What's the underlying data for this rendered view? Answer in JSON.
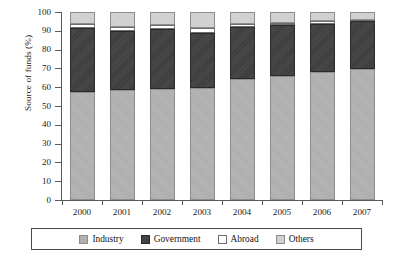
{
  "chart_data": {
    "type": "bar",
    "subtype": "stacked-bar-100",
    "title": "",
    "xlabel": "",
    "ylabel": "Source of funds (%)",
    "ylim": [
      0,
      100
    ],
    "ytick_step": 10,
    "yticks": [
      0,
      10,
      20,
      30,
      40,
      50,
      60,
      70,
      80,
      90,
      100
    ],
    "grid": false,
    "legend_position": "bottom",
    "categories": [
      "2000",
      "2001",
      "2002",
      "2003",
      "2004",
      "2005",
      "2006",
      "2007"
    ],
    "series": [
      {
        "name": "Industry",
        "color": "#b4b4b4",
        "values": [
          57.5,
          58.5,
          59.0,
          59.5,
          64.5,
          66.0,
          68.0,
          69.5
        ]
      },
      {
        "name": "Government",
        "color": "#3f3f3f",
        "values": [
          34.0,
          31.5,
          32.0,
          29.5,
          27.5,
          27.0,
          25.5,
          25.5
        ]
      },
      {
        "name": "Abroad",
        "color": "#ffffff",
        "values": [
          2.0,
          2.0,
          2.0,
          2.5,
          1.5,
          1.0,
          1.5,
          1.0
        ]
      },
      {
        "name": "Others",
        "color": "#d3d3d3",
        "values": [
          6.5,
          8.0,
          7.0,
          8.5,
          6.5,
          6.0,
          5.0,
          4.0
        ]
      }
    ],
    "legend": [
      "Industry",
      "Government",
      "Abroad",
      "Others"
    ]
  }
}
